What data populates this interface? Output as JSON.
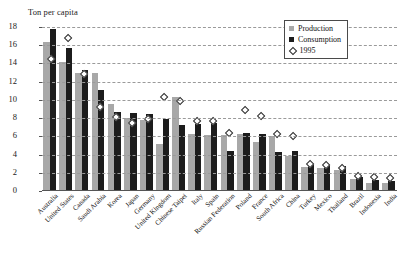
{
  "chart_data": {
    "type": "bar",
    "title": "Ton per capita",
    "xlabel": "",
    "ylabel": "Ton per capita",
    "ylim": [
      0,
      18
    ],
    "ytick_step": 2,
    "yticks": [
      0,
      2,
      4,
      6,
      8,
      10,
      12,
      14,
      16,
      18
    ],
    "grid": true,
    "legend_position": "top-right",
    "legend": [
      "Production",
      "Consumption",
      "1995"
    ],
    "categories": [
      "Australia",
      "United States",
      "Canada",
      "Saudi Arabia",
      "Korea",
      "Japan",
      "Germany",
      "United Kingdom",
      "Chinese Taipei",
      "Italy",
      "Spain",
      "Russian Federation",
      "Poland",
      "France",
      "South Africa",
      "China",
      "Turkey",
      "Mexico",
      "Thailand",
      "Brazil",
      "Indonesia",
      "India"
    ],
    "series": [
      {
        "name": "Production",
        "type": "bar",
        "color": "#a8a8a8",
        "values": [
          16.4,
          14.2,
          13.0,
          12.9,
          9.6,
          8.0,
          7.8,
          5.2,
          10.3,
          6.3,
          6.1,
          6.2,
          6.3,
          5.4,
          6.0,
          3.8,
          2.6,
          2.5,
          2.3,
          1.3,
          0.9,
          0.9
        ]
      },
      {
        "name": "Consumption",
        "type": "bar",
        "color": "#1c1c1c",
        "values": [
          17.8,
          15.7,
          13.3,
          11.1,
          8.7,
          8.6,
          8.5,
          7.9,
          7.3,
          7.4,
          7.5,
          4.4,
          6.4,
          6.3,
          4.3,
          4.4,
          3.0,
          2.9,
          2.8,
          1.5,
          1.2,
          1.1
        ]
      },
      {
        "name": "1995",
        "type": "scatter",
        "marker": "open-diamond",
        "color": "#2a2a2a",
        "values": [
          14.6,
          16.9,
          12.9,
          9.3,
          8.2,
          7.6,
          8.0,
          10.4,
          10.0,
          7.8,
          7.8,
          6.5,
          9.0,
          8.3,
          6.4,
          6.1,
          3.1,
          2.9,
          2.6,
          1.7,
          1.6,
          1.5
        ]
      }
    ]
  }
}
